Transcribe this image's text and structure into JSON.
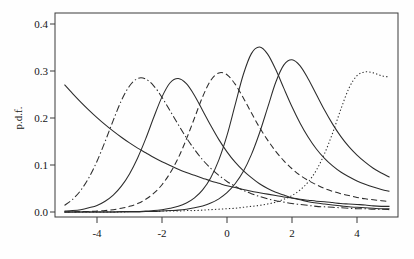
{
  "chart_data": {
    "type": "line",
    "title": "",
    "subtitle": "",
    "xlabel": "",
    "ylabel": "p.d.f.",
    "xlim": [
      -5,
      5
    ],
    "ylim": [
      0.0,
      0.42
    ],
    "grid": false,
    "legend": "none",
    "x_ticks": [
      -4,
      -2,
      0,
      2,
      4
    ],
    "x_tick_labels": [
      "-4",
      "-2",
      "0",
      "2",
      "4"
    ],
    "y_ticks": [
      0.0,
      0.1,
      0.2,
      0.3,
      0.4
    ],
    "y_tick_labels": [
      "0.0",
      "0.1",
      "0.2",
      "0.3",
      "0.4"
    ],
    "x": [
      -5.0,
      -4.75,
      -4.5,
      -4.25,
      -4.0,
      -3.75,
      -3.5,
      -3.25,
      -3.0,
      -2.75,
      -2.5,
      -2.25,
      -2.0,
      -1.75,
      -1.5,
      -1.25,
      -1.0,
      -0.75,
      -0.5,
      -0.25,
      0.0,
      0.25,
      0.5,
      0.75,
      1.0,
      1.25,
      1.5,
      1.75,
      2.0,
      2.25,
      2.5,
      2.75,
      3.0,
      3.25,
      3.5,
      3.75,
      4.0,
      4.25,
      4.5,
      4.75,
      5.0
    ],
    "series": [
      {
        "name": "curve-1",
        "linestyle": "solid",
        "peak_x": -5.0,
        "peak_y": 0.271,
        "values": [
          0.271,
          0.252,
          0.234,
          0.217,
          0.201,
          0.186,
          0.172,
          0.159,
          0.147,
          0.136,
          0.126,
          0.116,
          0.107,
          0.099,
          0.091,
          0.084,
          0.078,
          0.072,
          0.066,
          0.061,
          0.056,
          0.052,
          0.048,
          0.044,
          0.041,
          0.038,
          0.035,
          0.032,
          0.03,
          0.027,
          0.025,
          0.023,
          0.022,
          0.02,
          0.018,
          0.017,
          0.016,
          0.015,
          0.013,
          0.012,
          0.012
        ]
      },
      {
        "name": "curve-2",
        "linestyle": "dashdot",
        "peak_x": -2.8,
        "peak_y": 0.285,
        "values": [
          0.014,
          0.027,
          0.046,
          0.073,
          0.108,
          0.15,
          0.195,
          0.237,
          0.268,
          0.284,
          0.283,
          0.268,
          0.244,
          0.215,
          0.186,
          0.158,
          0.133,
          0.111,
          0.093,
          0.078,
          0.065,
          0.055,
          0.046,
          0.039,
          0.033,
          0.028,
          0.024,
          0.021,
          0.018,
          0.016,
          0.014,
          0.012,
          0.011,
          0.01,
          0.009,
          0.008,
          0.007,
          0.007,
          0.006,
          0.006,
          0.005
        ]
      },
      {
        "name": "curve-3",
        "linestyle": "solid",
        "peak_x": -1.8,
        "peak_y": 0.284,
        "values": [
          0.002,
          0.003,
          0.005,
          0.009,
          0.014,
          0.023,
          0.036,
          0.055,
          0.081,
          0.115,
          0.156,
          0.202,
          0.245,
          0.275,
          0.284,
          0.273,
          0.248,
          0.216,
          0.184,
          0.154,
          0.128,
          0.106,
          0.088,
          0.073,
          0.06,
          0.05,
          0.042,
          0.036,
          0.03,
          0.026,
          0.022,
          0.019,
          0.017,
          0.015,
          0.013,
          0.011,
          0.01,
          0.009,
          0.008,
          0.007,
          0.007
        ]
      },
      {
        "name": "curve-4",
        "linestyle": "dashed",
        "peak_x": -0.35,
        "peak_y": 0.297,
        "values": [
          0.0,
          0.0,
          0.001,
          0.001,
          0.002,
          0.003,
          0.005,
          0.008,
          0.012,
          0.018,
          0.027,
          0.04,
          0.058,
          0.083,
          0.115,
          0.155,
          0.2,
          0.245,
          0.28,
          0.296,
          0.292,
          0.272,
          0.243,
          0.211,
          0.18,
          0.153,
          0.129,
          0.109,
          0.092,
          0.078,
          0.067,
          0.058,
          0.05,
          0.044,
          0.039,
          0.035,
          0.031,
          0.028,
          0.026,
          0.024,
          0.022
        ]
      },
      {
        "name": "curve-5",
        "linestyle": "solid",
        "peak_x": 1.05,
        "peak_y": 0.351,
        "values": [
          0.0,
          0.0,
          0.0,
          0.0,
          0.0,
          0.0,
          0.0,
          0.001,
          0.001,
          0.001,
          0.002,
          0.003,
          0.005,
          0.008,
          0.012,
          0.019,
          0.03,
          0.047,
          0.073,
          0.111,
          0.163,
          0.228,
          0.292,
          0.337,
          0.351,
          0.336,
          0.303,
          0.263,
          0.224,
          0.189,
          0.159,
          0.134,
          0.114,
          0.098,
          0.085,
          0.075,
          0.066,
          0.059,
          0.053,
          0.048,
          0.044
        ]
      },
      {
        "name": "curve-6",
        "linestyle": "solid",
        "peak_x": 2.0,
        "peak_y": 0.324,
        "values": [
          0.0,
          0.0,
          0.0,
          0.0,
          0.0,
          0.0,
          0.0,
          0.0,
          0.0,
          0.0,
          0.001,
          0.001,
          0.002,
          0.003,
          0.004,
          0.006,
          0.009,
          0.013,
          0.019,
          0.028,
          0.041,
          0.06,
          0.086,
          0.122,
          0.168,
          0.222,
          0.276,
          0.313,
          0.324,
          0.311,
          0.283,
          0.25,
          0.217,
          0.187,
          0.161,
          0.139,
          0.121,
          0.106,
          0.093,
          0.083,
          0.074
        ]
      },
      {
        "name": "curve-7",
        "linestyle": "dotted",
        "peak_x": 4.6,
        "peak_y": 0.298,
        "values": [
          0.0,
          0.0,
          0.0,
          0.0,
          0.0,
          0.0,
          0.0,
          0.0,
          0.001,
          0.001,
          0.001,
          0.001,
          0.002,
          0.002,
          0.002,
          0.003,
          0.003,
          0.004,
          0.005,
          0.006,
          0.007,
          0.008,
          0.01,
          0.012,
          0.014,
          0.017,
          0.021,
          0.027,
          0.035,
          0.047,
          0.064,
          0.089,
          0.124,
          0.168,
          0.218,
          0.263,
          0.29,
          0.298,
          0.296,
          0.29,
          0.287
        ]
      }
    ]
  },
  "axes": {
    "ylabel": "p.d.f.",
    "x_tick_labels": [
      "-4",
      "-2",
      "0",
      "2",
      "4"
    ],
    "y_tick_labels": [
      "0.0",
      "0.1",
      "0.2",
      "0.3",
      "0.4"
    ]
  }
}
